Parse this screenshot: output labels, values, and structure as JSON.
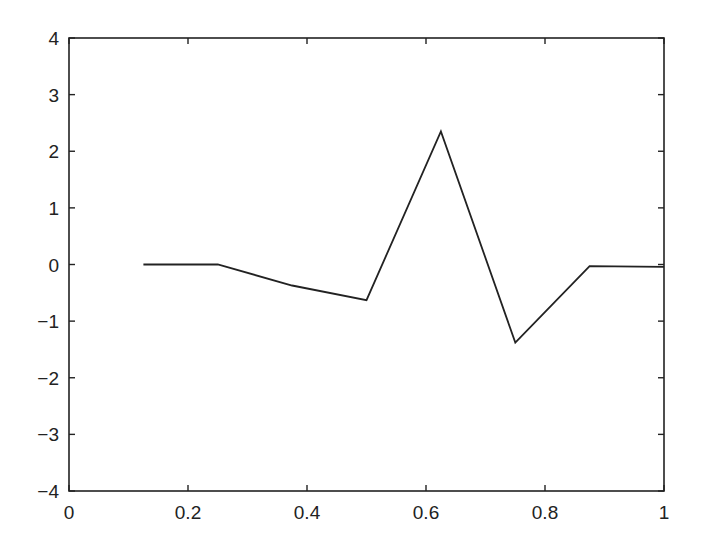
{
  "chart_data": {
    "type": "line",
    "title": "",
    "xlabel": "",
    "ylabel": "",
    "xlim": [
      0,
      1
    ],
    "ylim": [
      -4,
      4
    ],
    "grid": false,
    "legend": null,
    "x_ticks": [
      0,
      0.2,
      0.4,
      0.6,
      0.8,
      1
    ],
    "x_tick_labels": [
      "0",
      "0.2",
      "0.4",
      "0.6",
      "0.8",
      "1"
    ],
    "y_ticks": [
      -4,
      -3,
      -2,
      -1,
      0,
      1,
      2,
      3,
      4
    ],
    "y_tick_labels": [
      "−4",
      "−3",
      "−2",
      "−1",
      "0",
      "1",
      "2",
      "3",
      "4"
    ],
    "series": [
      {
        "name": "series-1",
        "color": "#222222",
        "x": [
          0.125,
          0.25,
          0.375,
          0.5,
          0.625,
          0.75,
          0.875,
          1.0
        ],
        "y": [
          0.0,
          0.0,
          -0.37,
          -0.63,
          2.35,
          -1.38,
          -0.03,
          -0.04
        ]
      }
    ]
  },
  "layout": {
    "plot_left": 69,
    "plot_right": 664,
    "plot_top": 38,
    "plot_bottom": 491,
    "axis_color": "#222222",
    "line_color": "#222222"
  }
}
